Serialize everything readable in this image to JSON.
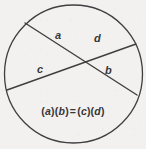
{
  "figure": {
    "type": "geometry-diagram",
    "background_color": "#f2f1ef",
    "stroke_color": "#3f3f42",
    "text_color": "#37373a",
    "circle": {
      "cx": 73.5,
      "cy": 74,
      "r": 69,
      "stroke_width": 1.3
    },
    "chords": [
      {
        "id": "chord-a-b",
        "x1": 25,
        "y1": 23,
        "x2": 137,
        "y2": 95,
        "stroke_width": 1.4,
        "segments": [
          "a",
          "b"
        ]
      },
      {
        "id": "chord-c-d",
        "x1": 7,
        "y1": 90,
        "x2": 136,
        "y2": 44,
        "stroke_width": 1.4,
        "segments": [
          "c",
          "d"
        ]
      }
    ],
    "intersection": {
      "x": 80,
      "y": 62
    },
    "labels": {
      "a": "a",
      "b": "b",
      "c": "c",
      "d": "d"
    },
    "formula": {
      "full_text": "(a)(b) = (c)(d)",
      "left_open": "(",
      "left_var1": "a",
      "left_mid": ")(",
      "left_var2": "b",
      "left_close": ")",
      "equals": "=",
      "right_open": "(",
      "right_var1": "c",
      "right_mid": ")(",
      "right_var2": "d",
      "right_close": ")"
    }
  }
}
